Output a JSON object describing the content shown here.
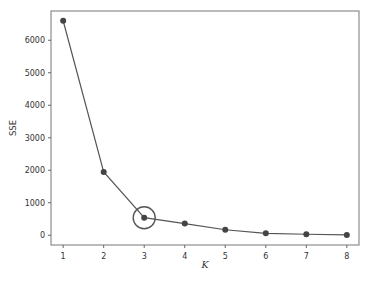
{
  "chart_data": {
    "type": "line",
    "title": "",
    "xlabel": "K",
    "ylabel": "SSE",
    "x": [
      1,
      2,
      3,
      4,
      5,
      6,
      7,
      8
    ],
    "series": [
      {
        "name": "SSE",
        "values": [
          6600,
          1950,
          540,
          360,
          170,
          60,
          30,
          10
        ]
      }
    ],
    "x_ticks": [
      "1",
      "2",
      "3",
      "4",
      "5",
      "6",
      "7",
      "8"
    ],
    "y_ticks": [
      "0",
      "1000",
      "2000",
      "3000",
      "4000",
      "5000",
      "6000"
    ],
    "xlim": [
      0.7,
      8.3
    ],
    "ylim": [
      -300,
      6900
    ],
    "grid": false,
    "legend": null,
    "annotations": [
      {
        "type": "circle",
        "x": 3,
        "y": 540,
        "note": "elbow point highlighted"
      }
    ],
    "colors": {
      "line": "#555555",
      "marker": "#444444",
      "axis": "#666666",
      "highlight": "#555555"
    }
  }
}
